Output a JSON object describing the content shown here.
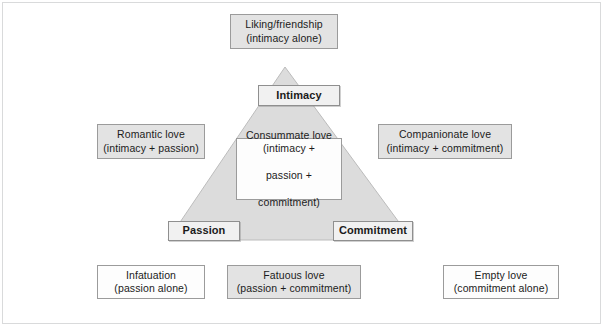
{
  "figure": {
    "triangle": {
      "fill": "#dcdcdc",
      "stroke": "#b4b4b4",
      "apex": "285,67",
      "left_vertex": "168,240",
      "right_vertex": "412,240"
    },
    "vertices": [
      {
        "id": "intimacy",
        "label": "Intimacy"
      },
      {
        "id": "passion",
        "label": "Passion"
      },
      {
        "id": "commitment",
        "label": "Commitment"
      }
    ],
    "boxes": {
      "liking": {
        "line1": "Liking/friendship",
        "line2": "(intimacy alone)"
      },
      "romantic": {
        "line1": "Romantic love",
        "line2": "(intimacy + passion)"
      },
      "companionate": {
        "line1": "Companionate love",
        "line2": "(intimacy + commitment)"
      },
      "consummate": {
        "line1": "Consummate love",
        "line2": "(intimacy +",
        "line3": "passion +",
        "line4": "commitment)"
      },
      "infatuation": {
        "line1": "Infatuation",
        "line2": "(passion alone)"
      },
      "fatuous": {
        "line1": "Fatuous love",
        "line2": "(passion + commitment)"
      },
      "empty": {
        "line1": "Empty love",
        "line2": "(commitment alone)"
      }
    }
  }
}
